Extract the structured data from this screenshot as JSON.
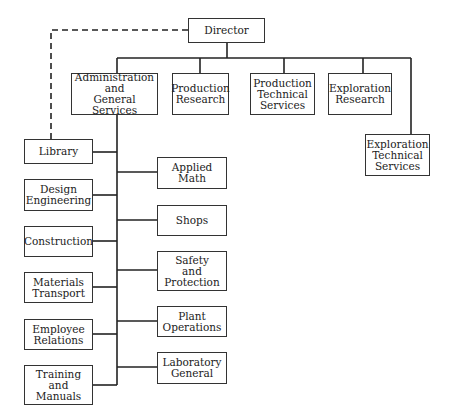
{
  "chart": {
    "root": {
      "label": "Director"
    },
    "top_level": [
      {
        "label": "Administration\nand\nGeneral Services"
      },
      {
        "label": "Production\nResearch"
      },
      {
        "label": "Production\nTechnical\nServices"
      },
      {
        "label": "Exploration\nResearch"
      },
      {
        "label": "Exploration\nTechnical\nServices"
      }
    ],
    "admin_left": [
      {
        "label": "Library"
      },
      {
        "label": "Design\nEngineering"
      },
      {
        "label": "Construction"
      },
      {
        "label": "Materials\nTransport"
      },
      {
        "label": "Employee\nRelations"
      },
      {
        "label": "Training\nand\nManuals"
      }
    ],
    "admin_right": [
      {
        "label": "Applied\nMath"
      },
      {
        "label": "Shops"
      },
      {
        "label": "Safety\nand\nProtection"
      },
      {
        "label": "Plant\nOperations"
      },
      {
        "label": "Laboratory\nGeneral"
      }
    ],
    "notes": {
      "dashed_link": "Director to Library (dashed line)"
    }
  },
  "colors": {
    "line": "#222222",
    "box_border": "#333333",
    "text": "#222222",
    "background": "#ffffff"
  }
}
